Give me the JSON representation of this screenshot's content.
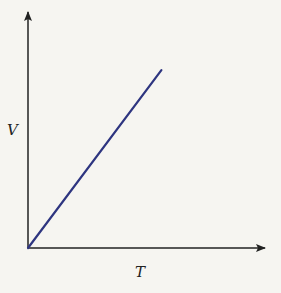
{
  "chart_data": {
    "type": "line",
    "title": "",
    "xlabel": "T",
    "ylabel": "V",
    "xlim": [
      0,
      1
    ],
    "ylim": [
      0,
      1
    ],
    "grid": false,
    "ticks": false,
    "series": [
      {
        "name": "V vs T",
        "color": "#2e3580",
        "x": [
          0,
          0.57
        ],
        "y": [
          0,
          0.76
        ]
      }
    ]
  },
  "colors": {
    "axis": "#222222",
    "background": "#f6f5f1"
  }
}
